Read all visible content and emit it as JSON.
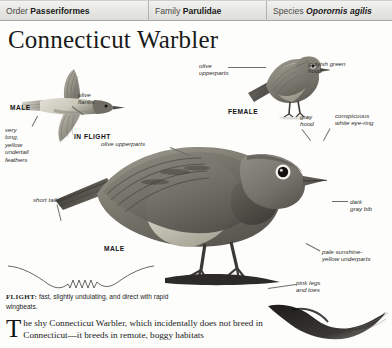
{
  "taxonomy": [
    {
      "key": "Order",
      "value": "Passeriformes",
      "italic": false
    },
    {
      "key": "Family",
      "value": "Parulidae",
      "italic": false
    },
    {
      "key": "Species",
      "value": "Oporornis agilis",
      "italic": true
    }
  ],
  "title": "Connecticut Warbler",
  "figures": {
    "flight_male": {
      "caption": "MALE",
      "state": "IN FLIGHT",
      "labels": {
        "flanks": "olive\nflanks",
        "undertail": "very\nlong,\nyellow\nundertail\nfeathers"
      }
    },
    "female": {
      "caption": "FEMALE",
      "labels": {
        "upperparts": "olive\nupperparts",
        "hood": "grayish green\nhood"
      }
    },
    "male_perched": {
      "caption": "MALE",
      "labels": {
        "upperparts": "olive upperparts",
        "hood": "gray\nhood",
        "eyering": "conspicuous\nwhite eye-ring",
        "bib": "dark\ngray bib",
        "underparts": "pale sunshine-\nyellow underparts",
        "legs": "pink legs\nand toes",
        "tail": "short tail"
      }
    }
  },
  "flight_note": {
    "label": "FLIGHT:",
    "text": " fast, slightly undulating, and direct with rapid wingbeats."
  },
  "body": {
    "dropcap": "T",
    "text": "he shy Connecticut Warbler, which incidentally does not breed in Connecticut—it breeds in remote, boggy habitats"
  },
  "colors": {
    "header_bg": "#e6e6e3",
    "rule": "#a8a8a4",
    "ink": "#1a1a1a",
    "label_ink": "#2e2e2c",
    "leader": "#6e6e6a"
  }
}
